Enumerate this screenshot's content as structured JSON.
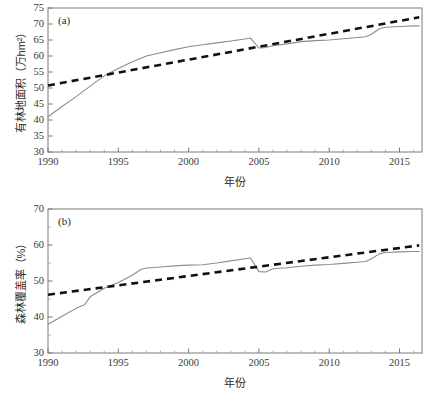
{
  "figure": {
    "width": 435,
    "height": 411,
    "background": "#ffffff",
    "solid_color": "#8c8c8c",
    "dashed_color": "#111111",
    "axis_color": "#7b7b7b"
  },
  "chart_data": [
    {
      "type": "line",
      "panel_label": "(a)",
      "title": "",
      "xlabel": "年份",
      "ylabel": "有林地面积（万hm²）",
      "xlim": [
        1990,
        2016.6
      ],
      "ylim": [
        30,
        75
      ],
      "xticks": [
        1990,
        1995,
        2000,
        2005,
        2010,
        2015
      ],
      "xticklabels": [
        "1990",
        "1995",
        "2000",
        "2005",
        "2010",
        "2015"
      ],
      "yticks": [
        30,
        35,
        40,
        45,
        50,
        55,
        60,
        65,
        70,
        75
      ],
      "yticklabels": [
        "30",
        "35",
        "40",
        "45",
        "50",
        "55",
        "60",
        "65",
        "70",
        "75"
      ],
      "x_minor_interval": 1,
      "y_minor": false,
      "grid": false,
      "legend": "none",
      "x": [
        1990,
        1991,
        1992,
        1993,
        1994,
        1995,
        1996,
        1997,
        1998,
        1999,
        2000,
        2001,
        2002,
        2003,
        2004,
        2004.4,
        2005,
        2005.4,
        2006,
        2007,
        2008,
        2009,
        2010,
        2011,
        2012,
        2012.6,
        2013,
        2013.6,
        2014,
        2015,
        2016,
        2016.4
      ],
      "series": [
        {
          "name": "有林地面积",
          "style": "solid",
          "color": "#8c8c8c",
          "values": [
            41.0,
            44.2,
            47.3,
            50.6,
            53.8,
            56.1,
            58.2,
            60.0,
            61.0,
            62.0,
            62.9,
            63.5,
            64.1,
            64.7,
            65.3,
            65.6,
            62.5,
            62.6,
            63.2,
            63.8,
            64.5,
            64.8,
            65.0,
            65.4,
            65.8,
            66.0,
            66.8,
            68.6,
            69.0,
            69.2,
            69.4,
            69.4
          ]
        },
        {
          "name": "线性趋势",
          "style": "dashed",
          "color": "#111111",
          "trend_start": [
            1990,
            50.8
          ],
          "trend_end": [
            2016.4,
            72.1
          ]
        }
      ]
    },
    {
      "type": "line",
      "panel_label": "(b)",
      "title": "",
      "xlabel": "年份",
      "ylabel": "森林覆盖率（%）",
      "xlim": [
        1990,
        2016.6
      ],
      "ylim": [
        30,
        70
      ],
      "xticks": [
        1990,
        1995,
        2000,
        2005,
        2010,
        2015
      ],
      "xticklabels": [
        "1990",
        "1995",
        "2000",
        "2005",
        "2010",
        "2015"
      ],
      "yticks": [
        30,
        40,
        50,
        60,
        70
      ],
      "yticklabels": [
        "30",
        "40",
        "50",
        "60",
        "70"
      ],
      "x_minor_interval": 1,
      "y_minor_interval": 5,
      "grid": false,
      "legend": "none",
      "x": [
        1990,
        1991,
        1992,
        1992.6,
        1993,
        1994,
        1995,
        1996,
        1996.6,
        1997,
        1998,
        1999,
        2000,
        2001,
        2002,
        2003,
        2004,
        2004.4,
        2005,
        2005.5,
        2006,
        2007,
        2008,
        2009,
        2010,
        2011,
        2012,
        2012.6,
        2013,
        2013.6,
        2014,
        2015,
        2016,
        2016.4
      ],
      "series": [
        {
          "name": "森林覆盖率",
          "style": "solid",
          "color": "#8c8c8c",
          "values": [
            38.0,
            40.2,
            42.4,
            43.4,
            45.6,
            48.0,
            49.6,
            51.6,
            53.2,
            53.6,
            53.9,
            54.2,
            54.4,
            54.5,
            55.0,
            55.6,
            56.2,
            56.4,
            52.6,
            52.5,
            53.4,
            53.7,
            54.1,
            54.4,
            54.6,
            54.9,
            55.2,
            55.4,
            56.2,
            57.6,
            57.9,
            58.1,
            58.2,
            58.2
          ]
        },
        {
          "name": "线性趋势",
          "style": "dashed",
          "color": "#111111",
          "trend_start": [
            1990,
            46.2
          ],
          "trend_end": [
            2016.4,
            59.9
          ]
        }
      ]
    }
  ]
}
